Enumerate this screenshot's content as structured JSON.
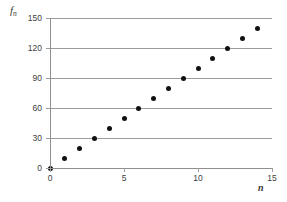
{
  "chart_data": {
    "type": "scatter",
    "title": "",
    "xlabel": "n",
    "ylabel": "f_n",
    "ylabel_base": "f",
    "ylabel_sub": "n",
    "x": [
      0,
      1,
      2,
      3,
      4,
      5,
      6,
      7,
      8,
      9,
      10,
      11,
      12,
      13,
      14
    ],
    "values": [
      0,
      10,
      20,
      30,
      40,
      50,
      60,
      70,
      80,
      90,
      100,
      110,
      120,
      130,
      140
    ],
    "xlim": [
      0,
      15
    ],
    "ylim": [
      0,
      150
    ],
    "xticks": [
      0,
      5,
      10,
      15
    ],
    "xtick_labels": [
      "0",
      "5",
      "10",
      "15"
    ],
    "yticks": [
      0,
      30,
      60,
      90,
      120,
      150
    ],
    "ytick_labels": [
      "0",
      "30",
      "60",
      "90",
      "120",
      "150"
    ],
    "grid": true,
    "grid_axis": "y",
    "legend": false,
    "marker": "filled-circle",
    "marker_color": "#111111",
    "gridline_color": "#9b9b9b",
    "axis_color": "#8f8f8f",
    "background_color": "#ffffff"
  }
}
